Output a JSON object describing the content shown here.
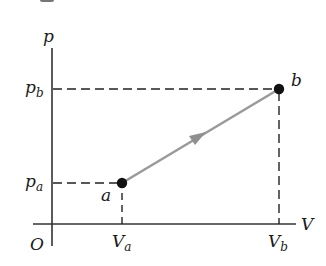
{
  "diagram": {
    "type": "pV-diagram",
    "axes": {
      "y_label": "p",
      "x_label": "V",
      "origin_label": "O"
    },
    "ticks": {
      "y": [
        {
          "base": "p",
          "sub": "b"
        },
        {
          "base": "p",
          "sub": "a"
        }
      ],
      "x": [
        {
          "base": "V",
          "sub": "a"
        },
        {
          "base": "V",
          "sub": "b"
        }
      ]
    },
    "points": [
      {
        "label": "a",
        "x_ref": "V_a",
        "y_ref": "p_a"
      },
      {
        "label": "b",
        "x_ref": "V_b",
        "y_ref": "p_b"
      }
    ],
    "process": {
      "from": "a",
      "to": "b",
      "shape": "straight line",
      "direction": "a to b"
    },
    "colors": {
      "axis": "#333333",
      "dashed": "#222222",
      "process_line": "#9a9a9a",
      "point": "#111111"
    }
  }
}
